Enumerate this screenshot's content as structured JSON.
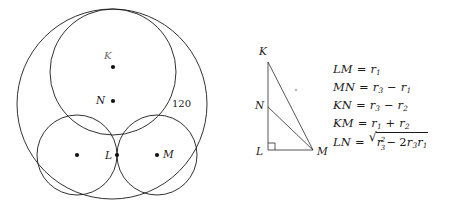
{
  "circle_diagram": {
    "name": "tangent-circles-diagram",
    "outer_circle": {
      "cx": 112,
      "cy": 104,
      "r": 95
    },
    "inner_circles": [
      {
        "id": "big-inner-circle",
        "cx": 113,
        "cy": 72,
        "r": 63,
        "label": "K",
        "label_dx": -4,
        "label_dy": -12
      },
      {
        "id": "left-small-circle",
        "cx": 77,
        "cy": 155,
        "r": 40,
        "label": "",
        "label_dx": 0,
        "label_dy": 0
      },
      {
        "id": "right-small-circle",
        "cx": 157,
        "cy": 155,
        "r": 40,
        "label": "M",
        "label_dx": 6,
        "label_dy": 0
      }
    ],
    "points": [
      {
        "name": "point-K",
        "label": "K",
        "x": 113,
        "y": 67,
        "label_x": 105,
        "label_y": 53,
        "dot": true
      },
      {
        "name": "point-N",
        "label": "N",
        "x": 113,
        "y": 101,
        "label_x": 97,
        "label_y": 95,
        "dot": true
      },
      {
        "name": "point-L",
        "label": "L",
        "x": 117,
        "y": 155,
        "label_x": 105,
        "label_y": 150,
        "dot": true
      },
      {
        "name": "point-M",
        "label": "M",
        "x": 157,
        "y": 155,
        "label_x": 163,
        "label_y": 149,
        "dot": true
      },
      {
        "name": "point-left-center",
        "label": "",
        "x": 77,
        "y": 155,
        "label_x": 0,
        "label_y": 0,
        "dot": true
      }
    ],
    "annotation": {
      "name": "radius-annotation-120",
      "text": "120",
      "x": 174,
      "y": 104
    }
  },
  "triangle_diagram": {
    "name": "right-triangle-KLM",
    "vertices": [
      {
        "name": "vertex-K",
        "label": "K",
        "x": 268,
        "y": 62,
        "label_x": 259,
        "label_y": 48
      },
      {
        "name": "vertex-N",
        "label": "N",
        "x": 268,
        "y": 107,
        "label_x": 255,
        "label_y": 101
      },
      {
        "name": "vertex-L",
        "label": "L",
        "x": 268,
        "y": 150,
        "label_x": 255,
        "label_y": 146
      },
      {
        "name": "vertex-M",
        "label": "M",
        "x": 313,
        "y": 150,
        "label_x": 318,
        "label_y": 146
      }
    ],
    "right_angle_at": "L",
    "segments": [
      "K-L",
      "L-M",
      "K-M",
      "N-M"
    ],
    "stray_mark": {
      "name": "stray-dot",
      "x": 296,
      "y": 90
    }
  },
  "equations": [
    {
      "name": "equation-LM",
      "lhs": "LM",
      "operator": "=",
      "plain": "LM = r_1",
      "rhs_parts": [
        {
          "base": "r",
          "sub": "1"
        }
      ],
      "kind": "simple"
    },
    {
      "name": "equation-MN",
      "lhs": "MN",
      "operator": "=",
      "plain": "MN = r_3 - r_1",
      "rhs_parts": [
        {
          "base": "r",
          "sub": "3"
        },
        {
          "op": "−"
        },
        {
          "base": "r",
          "sub": "1"
        }
      ],
      "kind": "simple"
    },
    {
      "name": "equation-KN",
      "lhs": "KN",
      "operator": "=",
      "plain": "KN = r_3 - r_2",
      "rhs_parts": [
        {
          "base": "r",
          "sub": "3"
        },
        {
          "op": "−"
        },
        {
          "base": "r",
          "sub": "2"
        }
      ],
      "kind": "simple"
    },
    {
      "name": "equation-KM",
      "lhs": "KM",
      "operator": "=",
      "plain": "KM = r_1 + r_2",
      "rhs_parts": [
        {
          "base": "r",
          "sub": "1"
        },
        {
          "op": "+"
        },
        {
          "base": "r",
          "sub": "2"
        }
      ],
      "kind": "simple"
    },
    {
      "name": "equation-LN",
      "lhs": "LN",
      "operator": "=",
      "plain": "LN = sqrt(r_3^2 - 2 r_3 r_1)",
      "radicand": "r_3^2 - 2 r_3 r_1",
      "kind": "radical"
    }
  ],
  "symbols": {
    "radical_sign": "√",
    "minus": "−",
    "equals": "=",
    "plus": "+"
  },
  "colors": {
    "stroke": "#1a1a1a",
    "text": "#1a1a1a",
    "background": "#ffffff"
  }
}
